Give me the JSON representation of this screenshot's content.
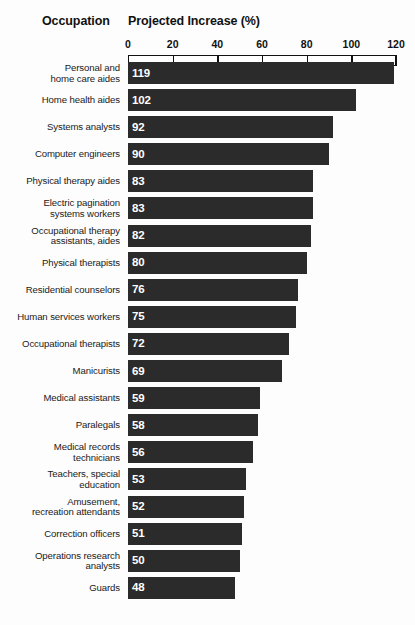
{
  "header": {
    "occupation_label": "Occupation",
    "value_label": "Projected Increase (%)"
  },
  "colors": {
    "bar_fill": "#2b2b2b",
    "value_text": "#ffffff",
    "axis": "#111111",
    "background": "#fdfdfd"
  },
  "chart_data": {
    "type": "bar",
    "orientation": "horizontal",
    "title": "Projected Increase (%)",
    "xlabel": "Projected Increase (%)",
    "ylabel": "Occupation",
    "xlim": [
      0,
      120
    ],
    "xticks": [
      0,
      20,
      40,
      60,
      80,
      100,
      120
    ],
    "grid": true,
    "legend": "none",
    "categories": [
      "Personal and\nhome care aides",
      "Home health aides",
      "Systems analysts",
      "Computer engineers",
      "Physical therapy aides",
      "Electric pagination\nsystems workers",
      "Occupational therapy\nassistants, aides",
      "Physical therapists",
      "Residential counselors",
      "Human services workers",
      "Occupational therapists",
      "Manicurists",
      "Medical assistants",
      "Paralegals",
      "Medical records\ntechnicians",
      "Teachers, special\neducation",
      "Amusement,\nrecreation attendants",
      "Correction officers",
      "Operations research\nanalysts",
      "Guards"
    ],
    "values": [
      119,
      102,
      92,
      90,
      83,
      83,
      82,
      80,
      76,
      75,
      72,
      69,
      59,
      58,
      56,
      53,
      52,
      51,
      50,
      48
    ]
  }
}
